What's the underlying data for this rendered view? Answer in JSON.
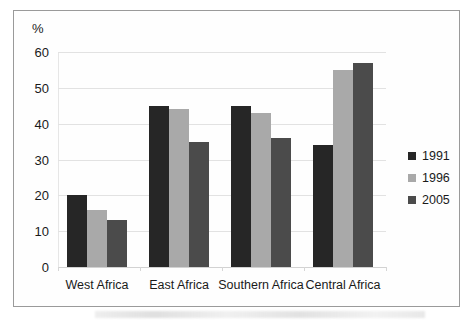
{
  "chart_data": {
    "type": "bar",
    "title": "",
    "xlabel": "",
    "ylabel": "%",
    "ylim": [
      0,
      60
    ],
    "yticks": [
      0,
      10,
      20,
      30,
      40,
      50,
      60
    ],
    "grid": true,
    "legend_position": "right",
    "categories": [
      "West Africa",
      "East Africa",
      "Southern Africa",
      "Central Africa"
    ],
    "series": [
      {
        "name": "1991",
        "color": "#262626",
        "values": [
          20,
          45,
          45,
          34
        ]
      },
      {
        "name": "1996",
        "color": "#a9a9a9",
        "values": [
          16,
          44,
          43,
          55
        ]
      },
      {
        "name": "2005",
        "color": "#4b4b4b",
        "values": [
          13,
          35,
          36,
          57
        ]
      }
    ]
  },
  "axis": {
    "unit_label": "%"
  }
}
